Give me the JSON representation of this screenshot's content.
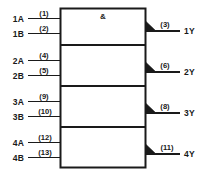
{
  "diagram": {
    "qualifying_symbol": "&",
    "colors": {
      "ink": "#1a1a1a",
      "background": "#ffffff"
    },
    "gates": [
      {
        "id": "gate-1",
        "inputs": [
          {
            "label": "1A",
            "pin": "(1)"
          },
          {
            "label": "1B",
            "pin": "(2)"
          }
        ],
        "output": {
          "label": "1Y",
          "pin": "(3)"
        }
      },
      {
        "id": "gate-2",
        "inputs": [
          {
            "label": "2A",
            "pin": "(4)"
          },
          {
            "label": "2B",
            "pin": "(5)"
          }
        ],
        "output": {
          "label": "2Y",
          "pin": "(6)"
        }
      },
      {
        "id": "gate-3",
        "inputs": [
          {
            "label": "3A",
            "pin": "(9)"
          },
          {
            "label": "3B",
            "pin": "(10)"
          }
        ],
        "output": {
          "label": "3Y",
          "pin": "(8)"
        }
      },
      {
        "id": "gate-4",
        "inputs": [
          {
            "label": "4A",
            "pin": "(12)"
          },
          {
            "label": "4B",
            "pin": "(13)"
          }
        ],
        "output": {
          "label": "4Y",
          "pin": "(11)"
        }
      }
    ]
  }
}
